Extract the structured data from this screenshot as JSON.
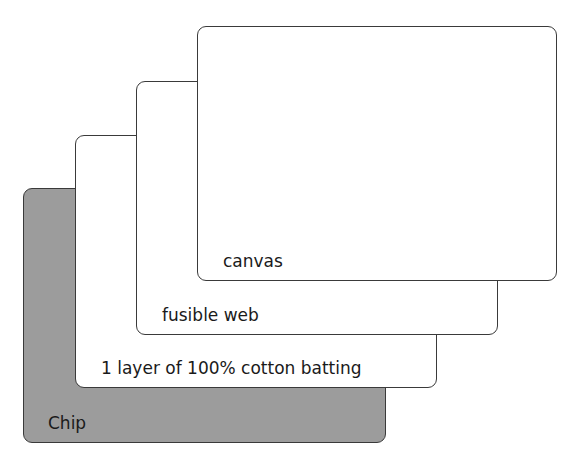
{
  "diagram": {
    "type": "layer-stack",
    "layers": [
      {
        "id": "canvas",
        "label": "canvas",
        "fill": "#ffffff"
      },
      {
        "id": "fusible",
        "label": "fusible web",
        "fill": "#ffffff"
      },
      {
        "id": "batting",
        "label": "1 layer of 100% cotton batting",
        "fill": "#ffffff"
      },
      {
        "id": "chip",
        "label": "Chip",
        "fill": "#9c9c9c"
      }
    ],
    "stroke_color": "#3a3a3a"
  }
}
